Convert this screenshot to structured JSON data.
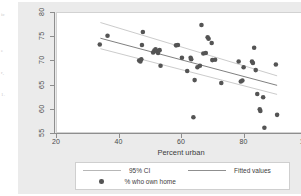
{
  "document_fragments": [
    {
      "text": "ic",
      "x": 1,
      "y": 12
    },
    {
      "text": "e",
      "x": 1,
      "y": 48
    },
    {
      "text": "r,",
      "x": 1,
      "y": 70
    },
    {
      "text": "1.",
      "x": 1,
      "y": 92
    }
  ],
  "axis_title_x": "Percent urban",
  "legend": {
    "ci_label": "95% CI",
    "fitted_label": "Fitted values",
    "points_label": "% who own home",
    "ci_icon": "line-swatch-icon",
    "fitted_icon": "line-swatch-icon",
    "points_icon": "dot-marker-icon"
  },
  "colors": {
    "canvas": "#ebebeb",
    "plot_bg": "#ffffff",
    "marker": "#545454",
    "fit_line": "#707070",
    "ci_line": "#bdbdbd",
    "axis": "#8e8e8e",
    "text": "#3d3d3d"
  },
  "chart_data": {
    "type": "scatter",
    "title": "",
    "xlabel": "Percent urban",
    "ylabel": "",
    "xlim": [
      20,
      100
    ],
    "ylim": [
      55,
      80
    ],
    "xticks": [
      20,
      40,
      60,
      80,
      100
    ],
    "yticks": [
      55,
      60,
      65,
      70,
      75,
      80
    ],
    "grid": false,
    "legend_position": "below-plot",
    "series": [
      {
        "name": "% who own home",
        "type": "scatter",
        "marker": "filled-circle",
        "color": "#545454",
        "points": [
          [
            33.8,
            73.4
          ],
          [
            36.3,
            75.2
          ],
          [
            46.5,
            70.0
          ],
          [
            46.9,
            69.8
          ],
          [
            47.2,
            70.3
          ],
          [
            47.4,
            73.3
          ],
          [
            47.7,
            76.0
          ],
          [
            51.0,
            71.7
          ],
          [
            51.4,
            72.1
          ],
          [
            51.8,
            72.4
          ],
          [
            52.2,
            72.0
          ],
          [
            52.6,
            71.6
          ],
          [
            53.1,
            72.2
          ],
          [
            53.4,
            68.9
          ],
          [
            58.4,
            73.2
          ],
          [
            59.0,
            73.3
          ],
          [
            60.3,
            70.6
          ],
          [
            62.0,
            67.8
          ],
          [
            63.1,
            70.6
          ],
          [
            63.3,
            70.3
          ],
          [
            64.0,
            58.1
          ],
          [
            64.4,
            65.9
          ],
          [
            65.3,
            68.6
          ],
          [
            66.1,
            68.9
          ],
          [
            66.6,
            77.5
          ],
          [
            67.2,
            71.5
          ],
          [
            68.0,
            71.6
          ],
          [
            68.6,
            74.9
          ],
          [
            68.9,
            74.6
          ],
          [
            69.9,
            73.7
          ],
          [
            70.1,
            70.1
          ],
          [
            71.0,
            70.2
          ],
          [
            73.0,
            65.3
          ],
          [
            78.6,
            69.8
          ],
          [
            79.3,
            65.6
          ],
          [
            79.8,
            65.8
          ],
          [
            80.2,
            68.6
          ],
          [
            82.9,
            69.8
          ],
          [
            83.2,
            69.5
          ],
          [
            83.6,
            72.7
          ],
          [
            84.1,
            68.0
          ],
          [
            84.6,
            63.0
          ],
          [
            85.4,
            59.8
          ],
          [
            85.6,
            59.4
          ],
          [
            86.5,
            62.3
          ],
          [
            86.9,
            55.9
          ],
          [
            90.6,
            69.2
          ],
          [
            91.0,
            58.6
          ]
        ]
      },
      {
        "name": "Fitted values",
        "type": "line",
        "color": "#707070",
        "x": [
          34.0,
          91.0
        ],
        "y": [
          74.7,
          64.8
        ]
      },
      {
        "name": "95% CI upper",
        "type": "line",
        "color": "#bdbdbd",
        "x": [
          34.0,
          91.0
        ],
        "y": [
          78.0,
          66.8
        ]
      },
      {
        "name": "95% CI lower",
        "type": "line",
        "color": "#bdbdbd",
        "x": [
          34.0,
          91.0
        ],
        "y": [
          72.5,
          62.9
        ]
      }
    ]
  }
}
